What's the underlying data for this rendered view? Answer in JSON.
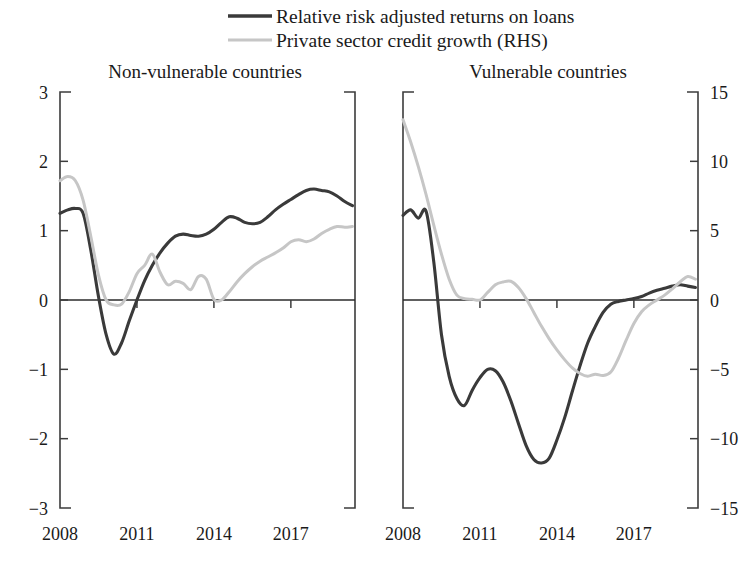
{
  "legend": {
    "position": "top-center",
    "entries": [
      {
        "label": "Relative risk adjusted returns on loans",
        "color": "#3a3a3a",
        "axis": "left"
      },
      {
        "label": "Private sector credit growth (RHS)",
        "color": "#c6c6c6",
        "axis": "right"
      }
    ]
  },
  "chart_data": {
    "type": "line",
    "title": "",
    "grid": false,
    "panels": [
      {
        "id": "non-vulnerable",
        "title": "Non-vulnerable countries",
        "xlabel": "",
        "ylabel": "",
        "xlim": [
          2008,
          2019.5
        ],
        "xticks": [
          2008,
          2011,
          2014,
          2017
        ],
        "xtick_labels": [
          "2008",
          "2011",
          "2014",
          "2017"
        ],
        "left_axis": {
          "ylim": [
            -3,
            3
          ],
          "yticks": [
            3,
            2,
            1,
            0,
            -1,
            -2,
            -3
          ],
          "ytick_labels": [
            "3",
            "2",
            "1",
            "0",
            "-1",
            "-2",
            "-3"
          ]
        },
        "right_axis": {
          "ylim": [
            -15,
            15
          ],
          "yticks": [
            15,
            10,
            5,
            0,
            -5,
            -10,
            -15
          ],
          "visible": false
        },
        "series": [
          {
            "name": "Relative risk adjusted returns on loans",
            "axis": "left",
            "color": "#3a3a3a",
            "x": [
              2008.0,
              2008.3,
              2008.6,
              2008.9,
              2009.2,
              2009.5,
              2009.8,
              2010.1,
              2010.4,
              2010.7,
              2011.0,
              2011.3,
              2011.6,
              2011.9,
              2012.2,
              2012.5,
              2012.8,
              2013.1,
              2013.4,
              2013.7,
              2014.0,
              2014.3,
              2014.6,
              2014.9,
              2015.2,
              2015.5,
              2015.8,
              2016.1,
              2016.4,
              2016.7,
              2017.0,
              2017.3,
              2017.6,
              2017.9,
              2018.2,
              2018.5,
              2018.8,
              2019.1,
              2019.4
            ],
            "y": [
              1.25,
              1.3,
              1.32,
              1.25,
              0.72,
              0.05,
              -0.5,
              -0.78,
              -0.62,
              -0.3,
              0.0,
              0.28,
              0.5,
              0.68,
              0.82,
              0.92,
              0.95,
              0.93,
              0.92,
              0.95,
              1.02,
              1.12,
              1.2,
              1.18,
              1.12,
              1.1,
              1.12,
              1.2,
              1.3,
              1.38,
              1.45,
              1.52,
              1.58,
              1.6,
              1.58,
              1.56,
              1.5,
              1.42,
              1.36
            ]
          },
          {
            "name": "Private sector credit growth (RHS)",
            "axis": "right",
            "color": "#c6c6c6",
            "x": [
              2008.0,
              2008.3,
              2008.6,
              2008.9,
              2009.2,
              2009.5,
              2009.8,
              2010.1,
              2010.4,
              2010.7,
              2011.0,
              2011.3,
              2011.6,
              2011.9,
              2012.2,
              2012.5,
              2012.8,
              2013.1,
              2013.4,
              2013.7,
              2014.0,
              2014.3,
              2014.6,
              2014.9,
              2015.2,
              2015.5,
              2015.8,
              2016.1,
              2016.4,
              2016.7,
              2017.0,
              2017.3,
              2017.6,
              2017.9,
              2018.2,
              2018.5,
              2018.8,
              2019.1,
              2019.4
            ],
            "y": [
              8.6,
              8.9,
              8.6,
              7.2,
              4.6,
              1.8,
              0.0,
              -0.35,
              -0.3,
              0.6,
              1.9,
              2.5,
              3.3,
              2.0,
              1.1,
              1.35,
              1.2,
              0.75,
              1.7,
              1.5,
              0.05,
              0.0,
              0.6,
              1.3,
              1.9,
              2.4,
              2.8,
              3.1,
              3.4,
              3.75,
              4.2,
              4.35,
              4.2,
              4.4,
              4.8,
              5.1,
              5.3,
              5.25,
              5.3
            ]
          }
        ]
      },
      {
        "id": "vulnerable",
        "title": "Vulnerable countries",
        "xlabel": "",
        "ylabel": "",
        "xlim": [
          2008,
          2019.5
        ],
        "xticks": [
          2008,
          2011,
          2014,
          2017
        ],
        "xtick_labels": [
          "2008",
          "2011",
          "2014",
          "2017"
        ],
        "left_axis": {
          "ylim": [
            -3,
            3
          ],
          "yticks": [
            3,
            2,
            1,
            0,
            -1,
            -2,
            -3
          ],
          "visible": false
        },
        "right_axis": {
          "ylim": [
            -15,
            15
          ],
          "yticks": [
            15,
            10,
            5,
            0,
            -5,
            -10,
            -15
          ],
          "ytick_labels": [
            "15",
            "10",
            "5",
            "0",
            "-5",
            "-10",
            "-15"
          ]
        },
        "series": [
          {
            "name": "Relative risk adjusted returns on loans",
            "axis": "left",
            "color": "#3a3a3a",
            "x": [
              2008.0,
              2008.3,
              2008.6,
              2008.9,
              2009.2,
              2009.5,
              2009.8,
              2010.1,
              2010.4,
              2010.7,
              2011.0,
              2011.3,
              2011.6,
              2011.9,
              2012.2,
              2012.5,
              2012.8,
              2013.1,
              2013.4,
              2013.7,
              2014.0,
              2014.3,
              2014.6,
              2014.9,
              2015.2,
              2015.5,
              2015.8,
              2016.1,
              2016.4,
              2016.7,
              2017.0,
              2017.3,
              2017.6,
              2017.9,
              2018.2,
              2018.5,
              2018.8,
              2019.1,
              2019.4
            ],
            "y": [
              1.22,
              1.3,
              1.18,
              1.28,
              0.55,
              -0.5,
              -1.1,
              -1.42,
              -1.52,
              -1.3,
              -1.12,
              -1.0,
              -1.02,
              -1.18,
              -1.45,
              -1.78,
              -2.1,
              -2.3,
              -2.35,
              -2.28,
              -2.02,
              -1.7,
              -1.32,
              -0.95,
              -0.62,
              -0.38,
              -0.18,
              -0.06,
              -0.02,
              0.0,
              0.02,
              0.05,
              0.1,
              0.14,
              0.17,
              0.2,
              0.22,
              0.2,
              0.18
            ]
          },
          {
            "name": "Private sector credit growth (RHS)",
            "axis": "right",
            "color": "#c6c6c6",
            "x": [
              2008.0,
              2008.3,
              2008.6,
              2008.9,
              2009.2,
              2009.5,
              2009.8,
              2010.1,
              2010.4,
              2010.7,
              2011.0,
              2011.3,
              2011.6,
              2011.9,
              2012.2,
              2012.5,
              2012.8,
              2013.1,
              2013.4,
              2013.7,
              2014.0,
              2014.3,
              2014.6,
              2014.9,
              2015.2,
              2015.5,
              2015.8,
              2016.1,
              2016.4,
              2016.7,
              2017.0,
              2017.3,
              2017.6,
              2017.9,
              2018.2,
              2018.5,
              2018.8,
              2019.1,
              2019.4
            ],
            "y": [
              13.0,
              11.4,
              9.6,
              7.6,
              5.4,
              3.3,
              1.5,
              0.35,
              0.1,
              0.05,
              0.0,
              0.55,
              1.1,
              1.3,
              1.35,
              0.9,
              0.1,
              -0.9,
              -1.9,
              -2.8,
              -3.6,
              -4.3,
              -4.9,
              -5.3,
              -5.5,
              -5.35,
              -5.45,
              -5.2,
              -4.2,
              -2.9,
              -1.7,
              -0.85,
              -0.35,
              0.0,
              0.35,
              0.8,
              1.3,
              1.7,
              1.5
            ]
          }
        ]
      }
    ]
  }
}
